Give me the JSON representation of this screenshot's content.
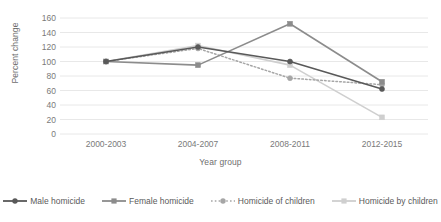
{
  "chart_data": {
    "type": "line",
    "title": "",
    "xlabel": "Year group",
    "ylabel": "Percent change",
    "categories": [
      "2000-2003",
      "2004-2007",
      "2008-2011",
      "2012-2015"
    ],
    "ylim": [
      0,
      160
    ],
    "ytick_step": 20,
    "yticks": [
      0,
      20,
      40,
      60,
      80,
      100,
      120,
      140,
      160
    ],
    "grid": "horizontal",
    "legend_position": "bottom",
    "series": [
      {
        "name": "Male homicide",
        "values": [
          100,
          120,
          100,
          62
        ],
        "color": "#595959",
        "marker": "circle",
        "linestyle": "solid"
      },
      {
        "name": "Female homicide",
        "values": [
          100,
          95,
          152,
          72
        ],
        "color": "#8c8c8c",
        "marker": "square",
        "linestyle": "solid"
      },
      {
        "name": "Homicide of children",
        "values": [
          100,
          118,
          77,
          68
        ],
        "color": "#a6a6a6",
        "marker": "circle",
        "linestyle": "dotted"
      },
      {
        "name": "Homicide by children",
        "values": [
          100,
          122,
          95,
          23
        ],
        "color": "#cfcfcf",
        "marker": "square",
        "linestyle": "solid"
      }
    ]
  },
  "axis": {
    "y_title": "Percent change",
    "x_title": "Year group",
    "y_tick_labels": [
      "160",
      "140",
      "120",
      "100",
      "80",
      "60",
      "40",
      "20",
      "0"
    ],
    "x_tick_labels": [
      "2000-2003",
      "2004-2007",
      "2008-2011",
      "2012-2015"
    ]
  },
  "legend": {
    "items": [
      {
        "label": "Male homicide"
      },
      {
        "label": "Female homicide"
      },
      {
        "label": "Homicide of children"
      },
      {
        "label": "Homicide by children"
      }
    ]
  },
  "colors": {
    "grid": "#e8e8e8",
    "axis_text": "#7a7a7a",
    "title_text": "#6e6e6e",
    "background": "#ffffff"
  }
}
